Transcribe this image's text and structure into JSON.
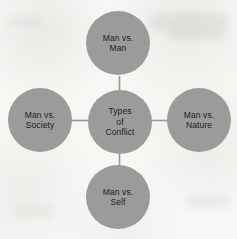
{
  "diagram": {
    "type": "hub-and-spoke",
    "title": "Types of Conflict",
    "background_color": "#f8f8f6",
    "node_fill_color": "#9b9b9b",
    "node_text_color": "#1e1e1e",
    "connector_color": "#9a9a9a",
    "center": {
      "id": "center",
      "label": "Types\nof\nConflict",
      "lines": [
        "Types",
        "of",
        "Conflict"
      ]
    },
    "nodes": [
      {
        "id": "top",
        "position": "top",
        "label": "Man vs.\nMan",
        "lines": [
          "Man vs.",
          "Man"
        ]
      },
      {
        "id": "left",
        "position": "left",
        "label": "Man vs.\nSociety",
        "lines": [
          "Man vs.",
          "Society"
        ]
      },
      {
        "id": "right",
        "position": "right",
        "label": "Man vs.\nNature",
        "lines": [
          "Man vs.",
          "Nature"
        ]
      },
      {
        "id": "bottom",
        "position": "bottom",
        "label": "Man vs.\nSelf",
        "lines": [
          "Man vs.",
          "Self"
        ]
      }
    ],
    "connectors": [
      {
        "from": "center",
        "to": "top"
      },
      {
        "from": "center",
        "to": "left"
      },
      {
        "from": "center",
        "to": "right"
      },
      {
        "from": "center",
        "to": "bottom"
      }
    ]
  }
}
